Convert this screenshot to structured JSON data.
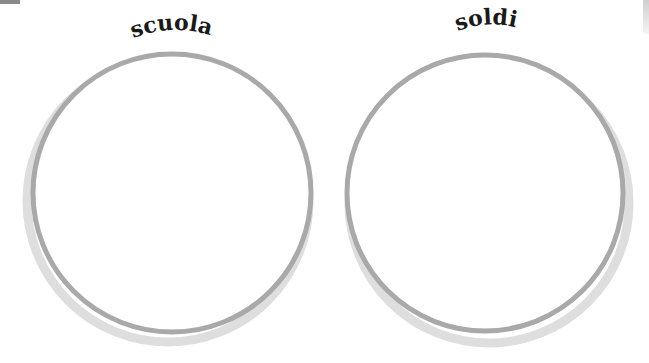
{
  "circles": [
    {
      "label": "scuola",
      "cx": 172,
      "cy": 193,
      "r": 139
    },
    {
      "label": "soldi",
      "cx": 485,
      "cy": 193,
      "r": 138
    }
  ],
  "colors": {
    "ring": "#a9a9a9",
    "shadow": "#dcdcdc",
    "text": "#1a1a1a",
    "background": "#ffffff"
  }
}
